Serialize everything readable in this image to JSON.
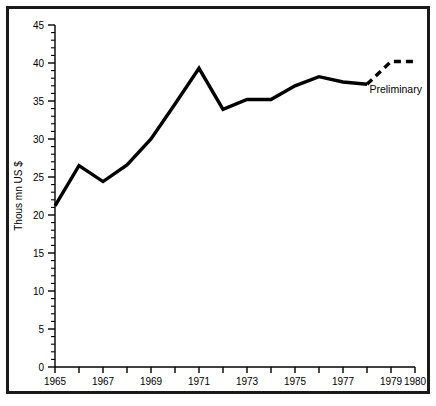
{
  "chart_data": {
    "type": "line",
    "title": "",
    "xlabel": "",
    "ylabel": "Thous mn US $",
    "xlim": [
      1965,
      1980
    ],
    "ylim": [
      0,
      45
    ],
    "grid": false,
    "legend": "none",
    "x": [
      1965,
      1966,
      1967,
      1968,
      1969,
      1970,
      1971,
      1972,
      1973,
      1974,
      1975,
      1976,
      1977,
      1978,
      1979,
      1980
    ],
    "series": [
      {
        "name": "Actual",
        "style": "solid",
        "x": [
          1965,
          1966,
          1967,
          1968,
          1969,
          1970,
          1971,
          1972,
          1973,
          1974,
          1975,
          1976,
          1977,
          1978
        ],
        "values": [
          21.2,
          26.5,
          24.4,
          26.6,
          30.0,
          34.6,
          39.3,
          33.9,
          35.2,
          35.2,
          37.0,
          38.2,
          37.5,
          37.2
        ]
      },
      {
        "name": "Preliminary",
        "style": "dashed",
        "x": [
          1978,
          1979,
          1980
        ],
        "values": [
          37.2,
          40.2,
          40.2
        ]
      }
    ],
    "y_ticks_major": [
      0,
      5,
      10,
      15,
      20,
      25,
      30,
      35,
      40,
      45
    ],
    "y_tick_labels": [
      "0",
      "5",
      "10",
      "15",
      "20",
      "25",
      "30",
      "35",
      "40",
      "45"
    ],
    "y_minor_step": 1,
    "x_ticks_major": [
      1965,
      1966,
      1967,
      1968,
      1969,
      1970,
      1971,
      1972,
      1973,
      1974,
      1975,
      1976,
      1977,
      1978,
      1979,
      1980
    ],
    "x_tick_labels": [
      {
        "value": 1965,
        "label": "1965"
      },
      {
        "value": 1967,
        "label": "1967"
      },
      {
        "value": 1969,
        "label": "1969"
      },
      {
        "value": 1971,
        "label": "1971"
      },
      {
        "value": 1973,
        "label": "1973"
      },
      {
        "value": 1975,
        "label": "1975"
      },
      {
        "value": 1977,
        "label": "1977"
      },
      {
        "value": 1979,
        "label": "1979"
      },
      {
        "value": 1980,
        "label": "1980"
      }
    ],
    "annotations": [
      {
        "name": "preliminary-label",
        "text": "Preliminary",
        "x": 1978.1,
        "y": 36.0
      }
    ],
    "colors": {
      "line": "#000000",
      "axis": "#000000",
      "background": "#ffffff",
      "frame": "#1a1a1a"
    }
  }
}
